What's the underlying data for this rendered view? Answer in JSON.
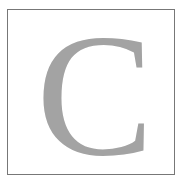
{
  "drop_cap": {
    "letter": "C",
    "color": "#a3a3a3",
    "border_color": "#777777"
  }
}
